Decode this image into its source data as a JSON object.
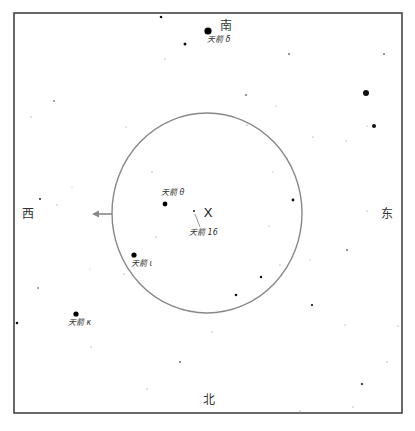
{
  "chart": {
    "frame": {
      "x": 14,
      "y": 13,
      "width": 388,
      "height": 400,
      "stroke": "#444444"
    },
    "field_circle": {
      "cx": 207,
      "cy": 213,
      "rx": 95,
      "ry": 100,
      "stroke": "#888888"
    },
    "direction_arrow": {
      "x1": 112,
      "y1": 214,
      "x2": 92,
      "y2": 214,
      "color": "#888888",
      "direction": "west"
    },
    "directions": [
      {
        "id": "south",
        "label": "南",
        "x": 226,
        "y": 26
      },
      {
        "id": "west",
        "label": "西",
        "x": 28,
        "y": 214
      },
      {
        "id": "east",
        "label": "东",
        "x": 387,
        "y": 214
      },
      {
        "id": "north",
        "label": "北",
        "x": 209,
        "y": 400
      }
    ],
    "target": {
      "label": "X",
      "x": 208,
      "y": 212
    },
    "named_stars": [
      {
        "name": "天箭 δ",
        "x": 208,
        "y": 31,
        "r": 3.6,
        "label_x": 207,
        "label_y": 36
      },
      {
        "name": "天箭 θ",
        "x": 165,
        "y": 204,
        "r": 2.4,
        "label_x": 161,
        "label_y": 189
      },
      {
        "name": "天箭 16",
        "x": 194,
        "y": 211,
        "r": 0.9,
        "label_x": 189,
        "label_y": 229
      },
      {
        "name": "天箭 ι",
        "x": 134,
        "y": 255,
        "r": 2.6,
        "label_x": 131,
        "label_y": 260
      },
      {
        "name": "天箭 κ",
        "x": 76,
        "y": 314,
        "r": 2.6,
        "label_x": 68,
        "label_y": 319
      }
    ],
    "pointer_line": {
      "x1": 195,
      "y1": 214,
      "x2": 200,
      "y2": 227
    },
    "stars": [
      {
        "x": 161,
        "y": 17,
        "r": 1.3
      },
      {
        "x": 185,
        "y": 44,
        "r": 1.5
      },
      {
        "x": 165,
        "y": 59,
        "r": 0.6
      },
      {
        "x": 289,
        "y": 54,
        "r": 0.8
      },
      {
        "x": 384,
        "y": 54,
        "r": 0.8
      },
      {
        "x": 366,
        "y": 93,
        "r": 3.0
      },
      {
        "x": 374,
        "y": 126,
        "r": 2.0
      },
      {
        "x": 246,
        "y": 95,
        "r": 0.8
      },
      {
        "x": 247,
        "y": 125,
        "r": 0.6
      },
      {
        "x": 276,
        "y": 106,
        "r": 0.5
      },
      {
        "x": 54,
        "y": 101,
        "r": 0.7
      },
      {
        "x": 126,
        "y": 127,
        "r": 0.5
      },
      {
        "x": 31,
        "y": 117,
        "r": 0.6
      },
      {
        "x": 40,
        "y": 199,
        "r": 0.9
      },
      {
        "x": 57,
        "y": 205,
        "r": 0.6
      },
      {
        "x": 72,
        "y": 187,
        "r": 0.4
      },
      {
        "x": 38,
        "y": 288,
        "r": 0.7
      },
      {
        "x": 17,
        "y": 323,
        "r": 1.3
      },
      {
        "x": 91,
        "y": 347,
        "r": 0.6
      },
      {
        "x": 90,
        "y": 269,
        "r": 0.4
      },
      {
        "x": 152,
        "y": 172,
        "r": 0.6
      },
      {
        "x": 156,
        "y": 237,
        "r": 0.6
      },
      {
        "x": 124,
        "y": 274,
        "r": 0.6
      },
      {
        "x": 293,
        "y": 200,
        "r": 1.4
      },
      {
        "x": 269,
        "y": 226,
        "r": 0.5
      },
      {
        "x": 280,
        "y": 265,
        "r": 0.6
      },
      {
        "x": 261,
        "y": 277,
        "r": 1.2
      },
      {
        "x": 236,
        "y": 295,
        "r": 1.3
      },
      {
        "x": 273,
        "y": 172,
        "r": 0.5
      },
      {
        "x": 313,
        "y": 137,
        "r": 0.6
      },
      {
        "x": 346,
        "y": 141,
        "r": 0.5
      },
      {
        "x": 367,
        "y": 126,
        "r": 0.5
      },
      {
        "x": 367,
        "y": 211,
        "r": 0.6
      },
      {
        "x": 347,
        "y": 250,
        "r": 0.8
      },
      {
        "x": 310,
        "y": 260,
        "r": 0.5
      },
      {
        "x": 212,
        "y": 332,
        "r": 0.6
      },
      {
        "x": 312,
        "y": 305,
        "r": 1.1
      },
      {
        "x": 345,
        "y": 325,
        "r": 0.5
      },
      {
        "x": 398,
        "y": 326,
        "r": 0.6
      },
      {
        "x": 387,
        "y": 362,
        "r": 0.6
      },
      {
        "x": 362,
        "y": 384,
        "r": 1.1
      },
      {
        "x": 353,
        "y": 407,
        "r": 0.6
      },
      {
        "x": 300,
        "y": 411,
        "r": 0.6
      },
      {
        "x": 180,
        "y": 362,
        "r": 0.8
      },
      {
        "x": 147,
        "y": 389,
        "r": 0.6
      },
      {
        "x": 196,
        "y": 228,
        "r": 0.4
      }
    ]
  }
}
